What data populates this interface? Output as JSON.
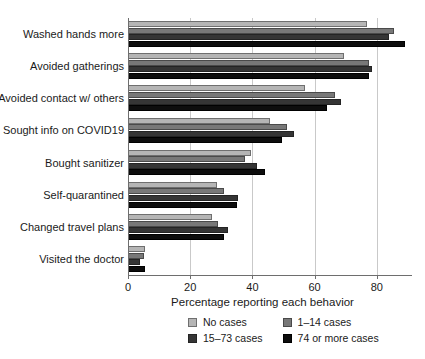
{
  "chart_data": {
    "type": "bar",
    "orientation": "horizontal",
    "title": "",
    "xlabel": "Percentage reporting each behavior",
    "ylabel": "",
    "xlim": [
      0,
      91
    ],
    "xticks": [
      0,
      20,
      40,
      60,
      80
    ],
    "xtick_labels": [
      "0",
      "20",
      "40",
      "60",
      "80"
    ],
    "grid": "vertical",
    "legend_position": "bottom",
    "categories": [
      "Washed hands more",
      "Avoided gatherings",
      "Avoided contact w/ others",
      "Sought info on COVID19",
      "Bought sanitizer",
      "Self-quarantined",
      "Changed travel plans",
      "Visited the doctor"
    ],
    "series": [
      {
        "name": "No cases",
        "color": "#b5b5b5",
        "values": [
          77,
          69.5,
          57,
          45.5,
          39.5,
          28.5,
          27,
          5.5
        ]
      },
      {
        "name": "1–14 cases",
        "color": "#787878",
        "values": [
          85.5,
          77.5,
          66.5,
          51,
          37.5,
          31,
          29,
          5
        ]
      },
      {
        "name": "15–73 cases",
        "color": "#353535",
        "values": [
          84,
          78.5,
          68.5,
          53.5,
          41.5,
          35.5,
          32,
          4
        ]
      },
      {
        "name": "74 or more cases",
        "color": "#0d0d0d",
        "values": [
          89,
          77.5,
          64,
          49.5,
          44,
          35,
          31,
          5.5
        ]
      }
    ]
  },
  "legend": {
    "items": [
      {
        "label": "No cases"
      },
      {
        "label": "1–14 cases"
      },
      {
        "label": "15–73 cases"
      },
      {
        "label": "74 or more cases"
      }
    ]
  }
}
